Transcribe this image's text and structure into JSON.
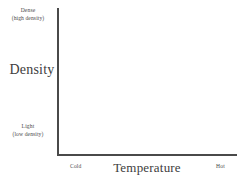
{
  "chart_data": {
    "type": "line",
    "title": "",
    "subtitle": "",
    "xlabel": "Temperature",
    "ylabel": "Density",
    "series": [],
    "categories": [],
    "values": [],
    "grid": false,
    "legend": "none",
    "x_axis": {
      "label": "Temperature",
      "ticks": [],
      "min_label": "Cold",
      "max_label": "Hot",
      "direction": "increasing"
    },
    "y_axis": {
      "label": "Density",
      "ticks": [],
      "min_label": "Light",
      "min_label_note": "(low density)",
      "max_label": "Dense",
      "max_label_note": "(high density)",
      "direction": "increasing"
    },
    "annotations": [],
    "note": "Empty axes diagram with no plotted data"
  },
  "figure": {
    "y_axis_title": "Density",
    "x_axis_title": "Temperature",
    "y_top_label": "Dense",
    "y_top_sublabel": "(high density)",
    "y_bottom_label": "Light",
    "y_bottom_sublabel": "(low density)",
    "x_left_label": "Cold",
    "x_right_label": "Hot"
  },
  "colors": {
    "background": "#ffffff",
    "axis": "#4a4a4a",
    "text": "#3d3d3d",
    "small_text": "#4b4b4b"
  }
}
